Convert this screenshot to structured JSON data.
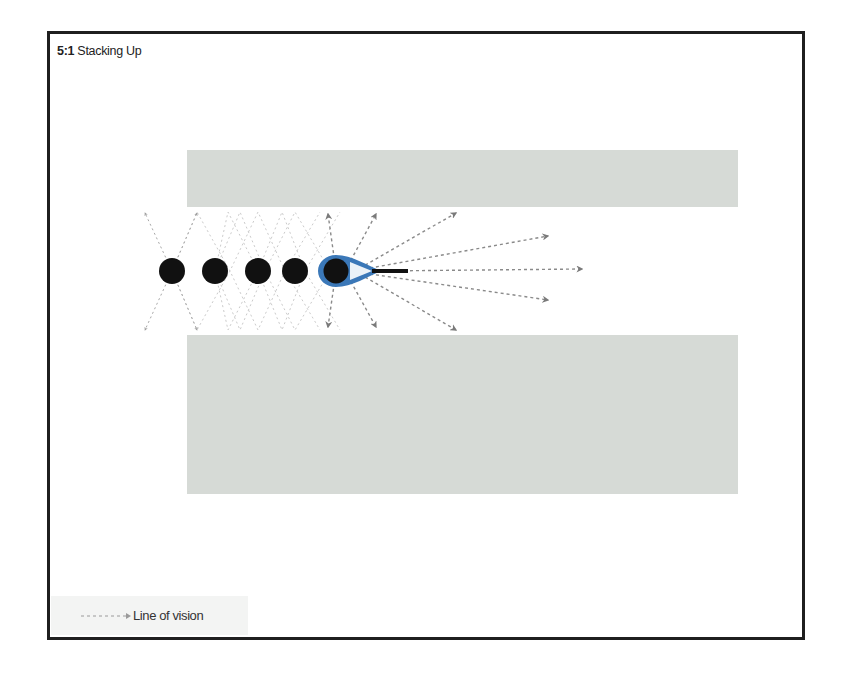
{
  "figure": {
    "number": "5:1",
    "title": "Stacking Up"
  },
  "legend": {
    "items": [
      {
        "symbol": "dotted-arrow",
        "label": "Line of vision"
      }
    ]
  },
  "diagram": {
    "walls": [
      {
        "name": "upper-wall",
        "x": 187,
        "y": 150,
        "width": 551,
        "height": 57,
        "color": "#d6dad6"
      },
      {
        "name": "lower-wall",
        "x": 187,
        "y": 335,
        "width": 551,
        "height": 159,
        "color": "#d6dad6"
      }
    ],
    "people": [
      {
        "x": 172,
        "y": 271
      },
      {
        "x": 215,
        "y": 271
      },
      {
        "x": 258,
        "y": 271
      },
      {
        "x": 295,
        "y": 271
      },
      {
        "x": 336,
        "y": 271,
        "highlighted": true
      }
    ],
    "highlight_color": "#3b78b8",
    "arrow_color": "#7a7a7a"
  }
}
